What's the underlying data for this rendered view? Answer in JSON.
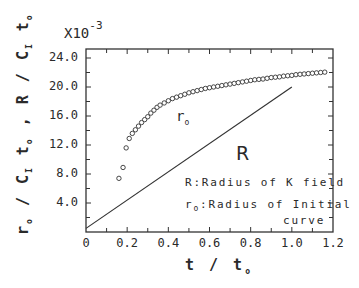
{
  "chart_data": {
    "type": "scatter",
    "title": "",
    "xlabel": "t / t₀",
    "ylabel": "r₀ / C₁ t₀ ,  R / C₁ t₀",
    "y_multiplier": "X10",
    "y_multiplier_exp": "-3",
    "xlim": [
      0,
      1.2
    ],
    "ylim": [
      0,
      25
    ],
    "x_ticks": [
      "0.2",
      "0.4",
      "0.6",
      "0.8",
      "1.0",
      "1.2"
    ],
    "x_origin_label": "0",
    "y_ticks": [
      "4.0",
      "8.0",
      "12.0",
      "16.0",
      "20.0",
      "24.0"
    ],
    "grid": false,
    "series": [
      {
        "name": "r₀ (Radius of Initial curve)",
        "marker": "open-circle",
        "x": [
          0.16,
          0.18,
          0.195,
          0.21,
          0.225,
          0.24,
          0.255,
          0.27,
          0.285,
          0.3,
          0.315,
          0.33,
          0.345,
          0.36,
          0.38,
          0.4,
          0.42,
          0.44,
          0.46,
          0.48,
          0.5,
          0.52,
          0.54,
          0.56,
          0.58,
          0.6,
          0.62,
          0.64,
          0.66,
          0.68,
          0.7,
          0.72,
          0.74,
          0.76,
          0.78,
          0.8,
          0.82,
          0.84,
          0.86,
          0.88,
          0.9,
          0.92,
          0.94,
          0.96,
          0.98,
          1.0,
          1.02,
          1.04,
          1.06,
          1.08,
          1.1,
          1.12,
          1.14,
          1.16
        ],
        "y": [
          7.4,
          8.9,
          11.6,
          12.9,
          13.6,
          14.1,
          14.6,
          15.1,
          15.5,
          15.9,
          16.4,
          16.8,
          17.2,
          17.5,
          17.8,
          18.1,
          18.4,
          18.6,
          18.8,
          19.0,
          19.2,
          19.35,
          19.5,
          19.65,
          19.8,
          19.9,
          20.0,
          20.1,
          20.2,
          20.3,
          20.4,
          20.5,
          20.6,
          20.7,
          20.8,
          20.9,
          21.0,
          21.05,
          21.1,
          21.2,
          21.3,
          21.35,
          21.4,
          21.5,
          21.55,
          21.6,
          21.7,
          21.75,
          21.8,
          21.85,
          21.9,
          21.95,
          22.0,
          22.05
        ]
      },
      {
        "name": "R (Radius of K field)",
        "marker": "line",
        "x": [
          0.0,
          1.0
        ],
        "y": [
          0.5,
          20.0
        ]
      }
    ],
    "annotations": [
      {
        "text": "r₀",
        "x": 0.46,
        "y": 15.7
      },
      {
        "text": "R",
        "x": 0.76,
        "y": 10.5
      }
    ],
    "legend": [
      "R:Radius of K field",
      "r₀:Radius of Initial curve"
    ],
    "legend_position": "lower right (inside)"
  },
  "labels": {
    "mult_base": "X10",
    "mult_exp": "-3",
    "ylabel_a": "r",
    "ylabel_a_sub": "o",
    "ylabel_mid1": " / C",
    "ylabel_mid1_sub": "I",
    "ylabel_t": " t",
    "ylabel_t_sub": "o",
    "ylabel_sep": " ,  R / C",
    "ylabel_sep_sub": "I",
    "ylabel_t2": " t",
    "ylabel_t2_sub": "o",
    "xlabel_main": "t / t",
    "xlabel_sub": "o",
    "ann_r0": "r",
    "ann_r0_sub": "o",
    "ann_R": "R",
    "legend1": "R:Radius of K field",
    "legend2_prefix": "r",
    "legend2_sub": "o",
    "legend2_text": ":Radius of Initial",
    "legend3": "curve",
    "x_origin": "0",
    "x_ticks": [
      "0.2",
      "0.4",
      "0.6",
      "0.8",
      "1.0",
      "1.2"
    ],
    "y_ticks": [
      "4.0",
      "8.0",
      "12.0",
      "16.0",
      "20.0",
      "24.0"
    ]
  }
}
